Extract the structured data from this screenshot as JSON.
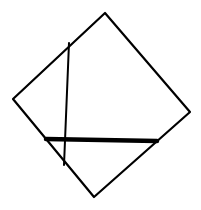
{
  "canvas": {
    "width": 201,
    "height": 210,
    "background": "#ffffff"
  },
  "stroke_color": "#000000",
  "square": {
    "vertices": [
      [
        105,
        13
      ],
      [
        190,
        112
      ],
      [
        94,
        197
      ],
      [
        13,
        99
      ]
    ],
    "stroke_width": 2.2
  },
  "vertical_line": {
    "x1": 69,
    "y1": 43,
    "x2": 64,
    "y2": 165,
    "stroke_width": 2
  },
  "thick_line": {
    "x1": 46,
    "y1": 139,
    "x2": 157,
    "y2": 141,
    "stroke_width": 4.5
  }
}
